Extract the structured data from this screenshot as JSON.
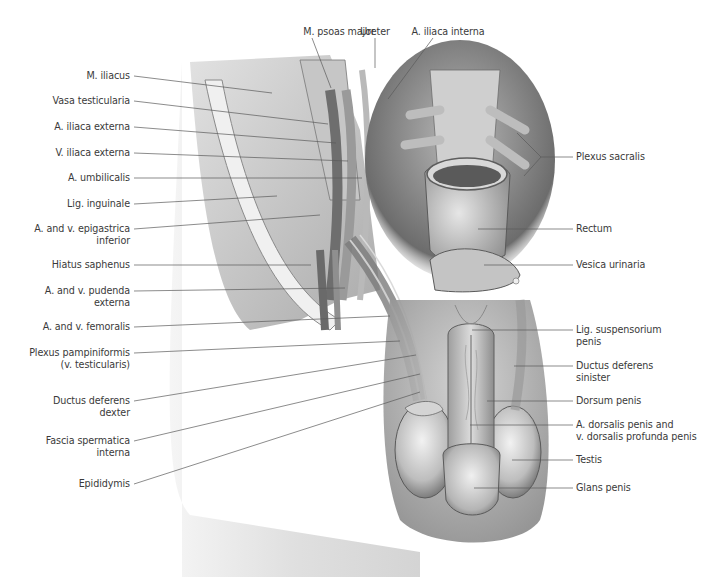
{
  "figure": {
    "artist_signature": "signature"
  },
  "labels_top": [
    {
      "id": "psoas",
      "text": "M. psoas major",
      "x": 339,
      "y": 32
    },
    {
      "id": "ureter",
      "text": "Ureter",
      "x": 375,
      "y": 32
    },
    {
      "id": "iliaca_interna",
      "text": "A. iliaca interna",
      "x": 448,
      "y": 32
    }
  ],
  "labels_left": [
    {
      "id": "iliacus",
      "lines": [
        "M. iliacus"
      ],
      "y": 76
    },
    {
      "id": "vasa_test",
      "lines": [
        "Vasa testicularia"
      ],
      "y": 101
    },
    {
      "id": "iliaca_ext_a",
      "lines": [
        "A. iliaca externa"
      ],
      "y": 127
    },
    {
      "id": "iliaca_ext_v",
      "lines": [
        "V. iliaca externa"
      ],
      "y": 153
    },
    {
      "id": "umbilicalis",
      "lines": [
        "A. umbilicalis"
      ],
      "y": 178
    },
    {
      "id": "inguinale",
      "lines": [
        "Lig. inguinale"
      ],
      "y": 204
    },
    {
      "id": "epigastrica",
      "lines": [
        "A. and v. epigastrica",
        "inferior"
      ],
      "y": 229
    },
    {
      "id": "saphenus",
      "lines": [
        "Hiatus saphenus"
      ],
      "y": 265
    },
    {
      "id": "pudenda",
      "lines": [
        "A. and v. pudenda",
        "externa"
      ],
      "y": 291
    },
    {
      "id": "femoralis",
      "lines": [
        "A. and v. femoralis"
      ],
      "y": 327
    },
    {
      "id": "pampiniformis",
      "lines": [
        "Plexus pampiniformis",
        "(v. testicularis)"
      ],
      "y": 353
    },
    {
      "id": "ductus_dexter",
      "lines": [
        "Ductus deferens",
        "dexter"
      ],
      "y": 401
    },
    {
      "id": "fascia",
      "lines": [
        "Fascia spermatica",
        "interna"
      ],
      "y": 441
    },
    {
      "id": "epididymis",
      "lines": [
        "Epididymis"
      ],
      "y": 484
    }
  ],
  "labels_right": [
    {
      "id": "plexus_sacralis",
      "lines": [
        "Plexus sacralis"
      ],
      "y": 157
    },
    {
      "id": "rectum",
      "lines": [
        "Rectum"
      ],
      "y": 229
    },
    {
      "id": "vesica",
      "lines": [
        "Vesica urinaria"
      ],
      "y": 265
    },
    {
      "id": "lig_susp",
      "lines": [
        "Lig. suspensorium",
        "penis"
      ],
      "y": 330
    },
    {
      "id": "ductus_sinister",
      "lines": [
        "Ductus deferens",
        "sinister"
      ],
      "y": 366
    },
    {
      "id": "dorsum",
      "lines": [
        "Dorsum penis"
      ],
      "y": 401
    },
    {
      "id": "a_dorsalis",
      "lines": [
        "A. dorsalis penis and",
        "v. dorsalis profunda penis"
      ],
      "y": 425
    },
    {
      "id": "testis",
      "lines": [
        "Testis"
      ],
      "y": 460
    },
    {
      "id": "glans",
      "lines": [
        "Glans penis"
      ],
      "y": 488
    }
  ],
  "leaders": {
    "left": [
      {
        "y1": 76,
        "x2": 272,
        "y2": 93
      },
      {
        "y1": 101,
        "x2": 328,
        "y2": 124
      },
      {
        "y1": 127,
        "x2": 336,
        "y2": 143
      },
      {
        "y1": 153,
        "x2": 348,
        "y2": 161
      },
      {
        "y1": 178,
        "x2": 362,
        "y2": 178
      },
      {
        "y1": 204,
        "x2": 277,
        "y2": 196
      },
      {
        "y1": 229,
        "x2": 320,
        "y2": 215
      },
      {
        "y1": 265,
        "x2": 311,
        "y2": 265
      },
      {
        "y1": 291,
        "x2": 345,
        "y2": 288
      },
      {
        "y1": 327,
        "x2": 390,
        "y2": 316
      },
      {
        "y1": 353,
        "x2": 400,
        "y2": 341
      },
      {
        "y1": 401,
        "x2": 416,
        "y2": 355
      },
      {
        "y1": 441,
        "x2": 420,
        "y2": 374
      },
      {
        "y1": 484,
        "x2": 420,
        "y2": 392
      }
    ],
    "right": [
      {
        "x1": 573,
        "y1": 330,
        "x2": 472,
        "y2": 330
      },
      {
        "x1": 573,
        "y1": 366,
        "x2": 514,
        "y2": 366
      },
      {
        "x1": 573,
        "y1": 401,
        "x2": 487,
        "y2": 401
      },
      {
        "x1": 573,
        "y1": 425,
        "x2": 470,
        "y2": 425
      },
      {
        "x1": 573,
        "y1": 460,
        "x2": 512,
        "y2": 460
      },
      {
        "x1": 573,
        "y1": 488,
        "x2": 474,
        "y2": 488
      },
      {
        "x1": 573,
        "y1": 229,
        "x2": 478,
        "y2": 229
      },
      {
        "x1": 573,
        "y1": 265,
        "x2": 484,
        "y2": 265
      }
    ],
    "top": [
      {
        "x1": 312,
        "y1": 38,
        "x2": 331,
        "y2": 88
      },
      {
        "x1": 375,
        "y1": 38,
        "x2": 375,
        "y2": 68
      },
      {
        "x1": 433,
        "y1": 38,
        "x2": 388,
        "y2": 99
      }
    ],
    "sacralis": [
      {
        "x1": 541,
        "y1": 157,
        "x2": 573,
        "y2": 157
      },
      {
        "x1": 541,
        "y1": 157,
        "x2": 517,
        "y2": 133
      },
      {
        "x1": 541,
        "y1": 157,
        "x2": 524,
        "y2": 176
      }
    ]
  },
  "colors": {
    "label_text": "#3a3a3a",
    "leader_line": "#5a5a5a",
    "illustration_light": "#e2e2e2",
    "illustration_mid": "#a8a8a8",
    "illustration_dark": "#4a4a4a",
    "background": "#ffffff"
  }
}
